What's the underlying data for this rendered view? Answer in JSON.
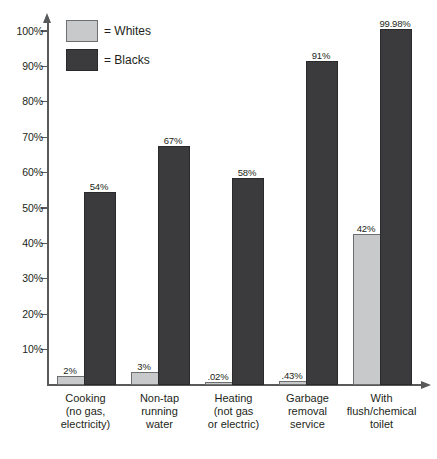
{
  "chart_data": {
    "type": "bar",
    "title": "",
    "subtitle": "",
    "xlabel": "",
    "ylabel": "",
    "ylim": [
      0,
      100
    ],
    "grid": false,
    "legend_position": "top-left",
    "y_ticks": [
      "10%",
      "20%",
      "30%",
      "40%",
      "50%",
      "60%",
      "70%",
      "80%",
      "90%",
      "100%"
    ],
    "y_tick_values": [
      10,
      20,
      30,
      40,
      50,
      60,
      70,
      80,
      90,
      100
    ],
    "categories": [
      "Cooking\n(no gas,\nelectricity)",
      "Non-tap\nrunning\nwater",
      "Heating\n(not gas\nor electric)",
      "Garbage\nremoval\nservice",
      "With\nflush/chemical\ntoilet"
    ],
    "series": [
      {
        "name": "Whites",
        "color": "#c8c9ca",
        "values": [
          2,
          3,
          0.02,
          0.43,
          42
        ],
        "labels": [
          "2%",
          "3%",
          ".02%",
          ".43%",
          "42%"
        ]
      },
      {
        "name": "Blacks",
        "color": "#3b3b3d",
        "values": [
          54,
          67,
          58,
          91,
          99.98
        ],
        "labels": [
          "54%",
          "67%",
          "58%",
          "91%",
          "99.98%"
        ]
      }
    ]
  },
  "legend": {
    "items": [
      {
        "label": "= Whites",
        "swatch": "white"
      },
      {
        "label": "= Blacks",
        "swatch": "black"
      }
    ]
  },
  "axis": {
    "y_axis_name": "percentage-axis",
    "x_axis_name": "category-axis"
  },
  "bottom_caption": ""
}
